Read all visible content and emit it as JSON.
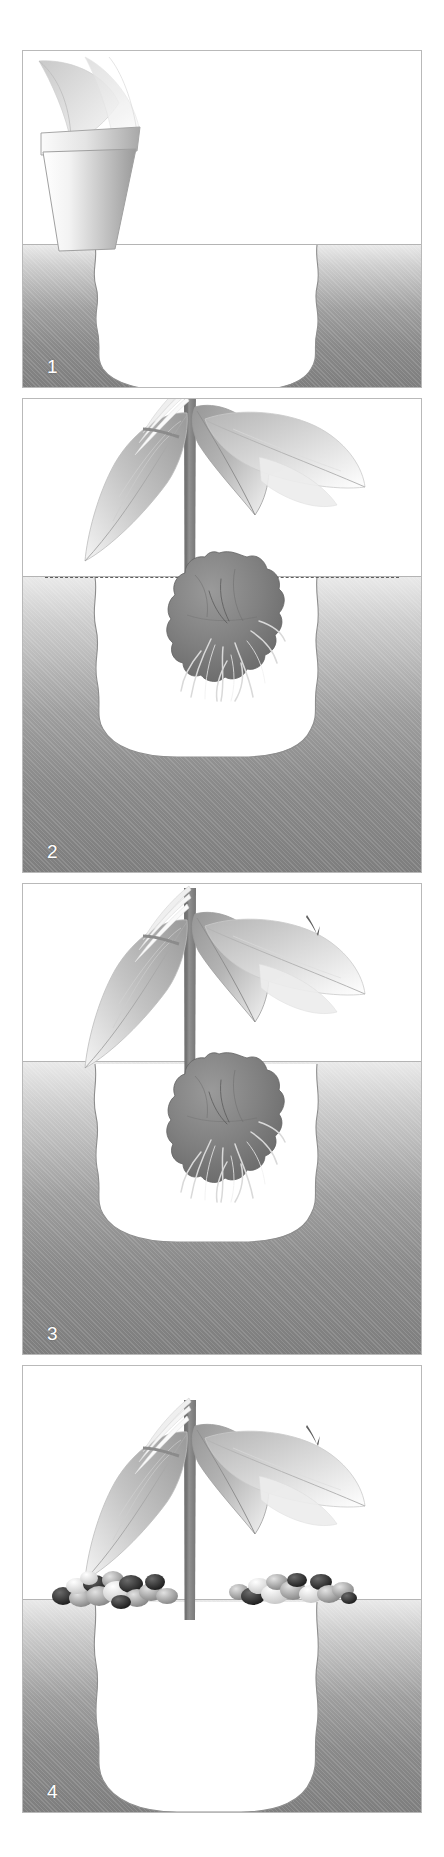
{
  "figure": {
    "panel_count": 4,
    "background_color": "#ffffff",
    "border_color": "#b9b9b9",
    "soil_color_top": "#e9e9e9",
    "soil_color_bottom": "#7e7e7e",
    "rootball_color": "#7a7a7a",
    "leaf_color": "#b3b3b3",
    "stem_color": "#8e8e8e",
    "label_color": "#ffffff"
  },
  "panels": [
    {
      "id": "panel-1",
      "number": "1",
      "caption": "Dig the planting hole and slide the plant out of its pot",
      "has_pot": true,
      "has_plant": false,
      "has_rootball": false,
      "has_level_line": false,
      "has_mulch": false,
      "has_prune_mark": false
    },
    {
      "id": "panel-2",
      "number": "2",
      "caption": "Hold the plant over the hole and check the soil level with a cane",
      "has_pot": false,
      "has_plant": true,
      "has_rootball": true,
      "has_level_line": true,
      "has_mulch": false,
      "has_prune_mark": false
    },
    {
      "id": "panel-3",
      "number": "3",
      "caption": "Lower the rootball into the hole and backfill around it",
      "has_pot": false,
      "has_plant": true,
      "has_rootball": true,
      "has_level_line": false,
      "has_mulch": false,
      "has_prune_mark": true
    },
    {
      "id": "panel-4",
      "number": "4",
      "caption": "Firm in and spread a mulch of gravel over the surface",
      "has_pot": false,
      "has_plant": true,
      "has_rootball": false,
      "has_level_line": false,
      "has_mulch": true,
      "has_prune_mark": true
    }
  ],
  "labels": {
    "step_1": "1",
    "step_2": "2",
    "step_3": "3",
    "step_4": "4"
  },
  "icons": {
    "plant": "plant-icon",
    "pot": "flower-pot-icon",
    "rootball": "rootball-icon",
    "mulch": "gravel-mulch-icon",
    "prune": "pruning-mark-icon",
    "soil_level": "soil-level-line-icon"
  }
}
